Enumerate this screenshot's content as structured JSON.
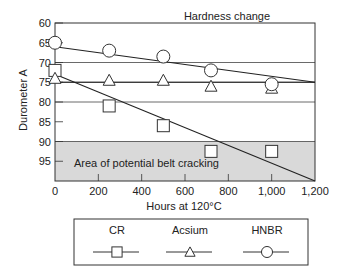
{
  "chart_data": {
    "type": "scatter",
    "title": "Hardness change",
    "xlabel": "Hours at 120°C",
    "ylabel": "Durometer A",
    "xlim": [
      0,
      1200
    ],
    "ylim": [
      100,
      60
    ],
    "y_inverted": true,
    "x_ticks": [
      0,
      200,
      400,
      600,
      800,
      1000,
      1200
    ],
    "x_tick_labels": [
      "0",
      "200",
      "400",
      "600",
      "800",
      "1,000",
      "1,200"
    ],
    "y_ticks": [
      60,
      65,
      70,
      75,
      80,
      85,
      90,
      95
    ],
    "y_tick_labels": [
      "60",
      "65",
      "70",
      "75",
      "80",
      "85",
      "90",
      "95"
    ],
    "gridlines_y": [
      70,
      75,
      80,
      90
    ],
    "shaded_region": {
      "y_from": 90,
      "y_to": 100,
      "label": "Area of potential belt cracking",
      "color": "#d9d9d9"
    },
    "series": [
      {
        "name": "CR",
        "marker": "square",
        "x": [
          0,
          250,
          500,
          720,
          1000
        ],
        "y": [
          72,
          81,
          86,
          92.5,
          92.5
        ],
        "trend": {
          "x": [
            0,
            1200
          ],
          "y": [
            73,
            100
          ]
        }
      },
      {
        "name": "Acsium",
        "marker": "triangle",
        "x": [
          0,
          250,
          500,
          720,
          1000
        ],
        "y": [
          74,
          74.5,
          74.5,
          76,
          76.5
        ],
        "trend": {
          "x": [
            0,
            1200
          ],
          "y": [
            75,
            75
          ]
        }
      },
      {
        "name": "HNBR",
        "marker": "circle",
        "x": [
          0,
          250,
          500,
          720,
          1000
        ],
        "y": [
          65,
          67,
          68.5,
          72,
          75.5
        ],
        "trend": {
          "x": [
            0,
            1200
          ],
          "y": [
            66,
            75
          ]
        }
      }
    ],
    "legend_position": "bottom"
  },
  "labels": {
    "title": "Hardness change",
    "xlabel": "Hours at 120°C",
    "ylabel": "Durometer A",
    "region": "Area of potential belt cracking"
  },
  "legend": [
    {
      "label": "CR",
      "marker": "square"
    },
    {
      "label": "Acsium",
      "marker": "triangle"
    },
    {
      "label": "HNBR",
      "marker": "circle"
    }
  ]
}
